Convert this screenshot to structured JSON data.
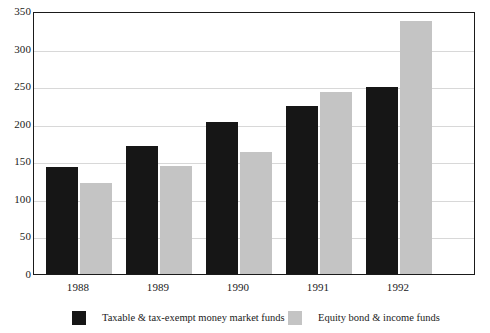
{
  "chart_data": {
    "type": "bar",
    "title": "",
    "xlabel": "",
    "ylabel": "",
    "categories": [
      "1988",
      "1989",
      "1990",
      "1991",
      "1992"
    ],
    "series": [
      {
        "name": "Taxable & tax-exempt money market funds",
        "color": "#161616",
        "values": [
          142,
          171,
          202,
          224,
          249
        ]
      },
      {
        "name": "Equity bond & income funds",
        "color": "#c4c4c4",
        "values": [
          121,
          144,
          163,
          242,
          337
        ]
      }
    ],
    "ylim": [
      0,
      350
    ],
    "ytick_values": [
      0,
      50,
      100,
      150,
      200,
      250,
      300,
      350
    ],
    "ytick_labels": [
      "0",
      "50",
      "100",
      "150",
      "200",
      "250",
      "300",
      "350"
    ],
    "grid": true,
    "legend_position": "bottom"
  },
  "legend": {
    "items": [
      {
        "label": "Taxable & tax-exempt money market funds",
        "color": "#161616"
      },
      {
        "label": "Equity bond & income funds",
        "color": "#c4c4c4"
      }
    ]
  },
  "top_strip": {
    "text": ""
  }
}
